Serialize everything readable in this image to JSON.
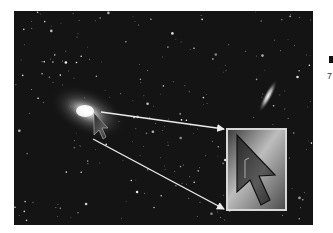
{
  "figure": {
    "background_color": "#141414",
    "main_galaxy": {
      "description": "bright spiral galaxy with glowing core"
    },
    "secondary_galaxy": {
      "description": "edge-on galaxy streak"
    },
    "cursor": {
      "icon": "arrow-cursor-icon",
      "description": "mouse pointer placed on galaxy core"
    },
    "magnifier": {
      "description": "enlarged view of the cursor",
      "border_color": "#d8d8d8"
    },
    "arrows": {
      "color": "#e8e8e8",
      "count": 2
    }
  },
  "side_text": {
    "fragment": "7"
  }
}
